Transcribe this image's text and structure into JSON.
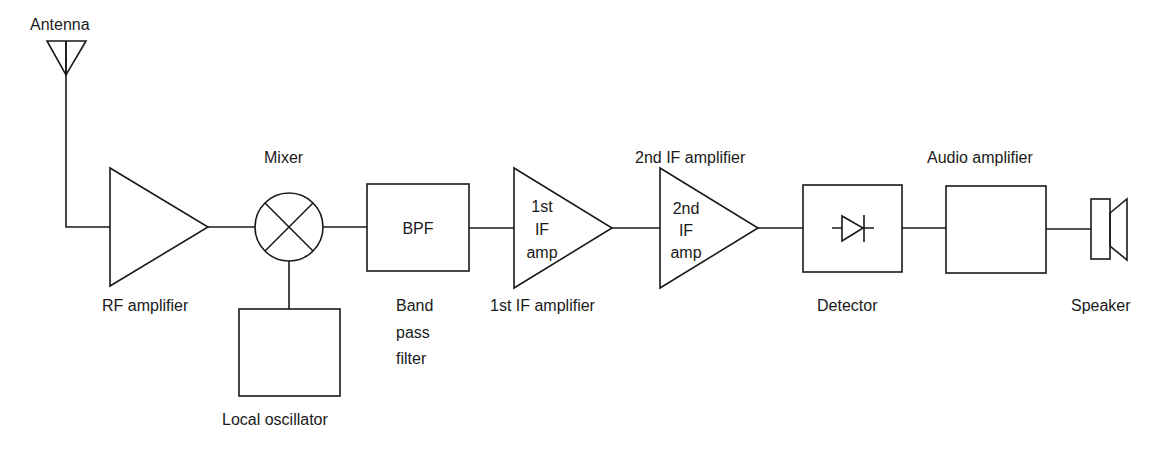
{
  "colors": {
    "line": "#1a1a1a",
    "background": "#ffffff"
  },
  "blocks": {
    "antenna": {
      "label": "Antenna",
      "icon": "antenna-icon"
    },
    "rf_amp": {
      "label": "RF amplifier",
      "icon": "amplifier-triangle-icon"
    },
    "mixer": {
      "label": "Mixer",
      "icon": "mixer-circle-x-icon"
    },
    "local_osc": {
      "label": "Local oscillator"
    },
    "bpf": {
      "inner": "BPF",
      "label_lines": [
        "Band",
        "pass",
        "filter"
      ]
    },
    "if1": {
      "inner_lines": [
        "1st",
        "IF",
        "amp"
      ],
      "label": "1st IF amplifier",
      "icon": "amplifier-triangle-icon"
    },
    "if2": {
      "inner_lines": [
        "2nd",
        "IF",
        "amp"
      ],
      "label": "2nd IF amplifier",
      "icon": "amplifier-triangle-icon"
    },
    "detector": {
      "label": "Detector",
      "icon": "diode-icon"
    },
    "audio_amp": {
      "label": "Audio amplifier"
    },
    "speaker": {
      "label": "Speaker",
      "icon": "speaker-icon"
    }
  },
  "signal_chain": [
    "Antenna",
    "RF amplifier",
    "Mixer",
    "BPF",
    "1st IF amp",
    "2nd IF amp",
    "Detector",
    "Audio amplifier",
    "Speaker"
  ],
  "side_inputs": [
    {
      "from": "Local oscillator",
      "to": "Mixer"
    }
  ]
}
